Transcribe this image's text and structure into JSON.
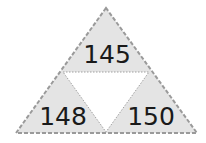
{
  "diagram": {
    "type": "number-triangle",
    "values": {
      "top": "145",
      "bottom_left": "148",
      "bottom_right": "150",
      "center": ""
    },
    "colors": {
      "fill": "#e4e4e4",
      "center_fill": "#ffffff",
      "outer_border": "#9a9a9a",
      "inner_lines": "#a0a0a0",
      "text": "#1a1a1a"
    }
  }
}
